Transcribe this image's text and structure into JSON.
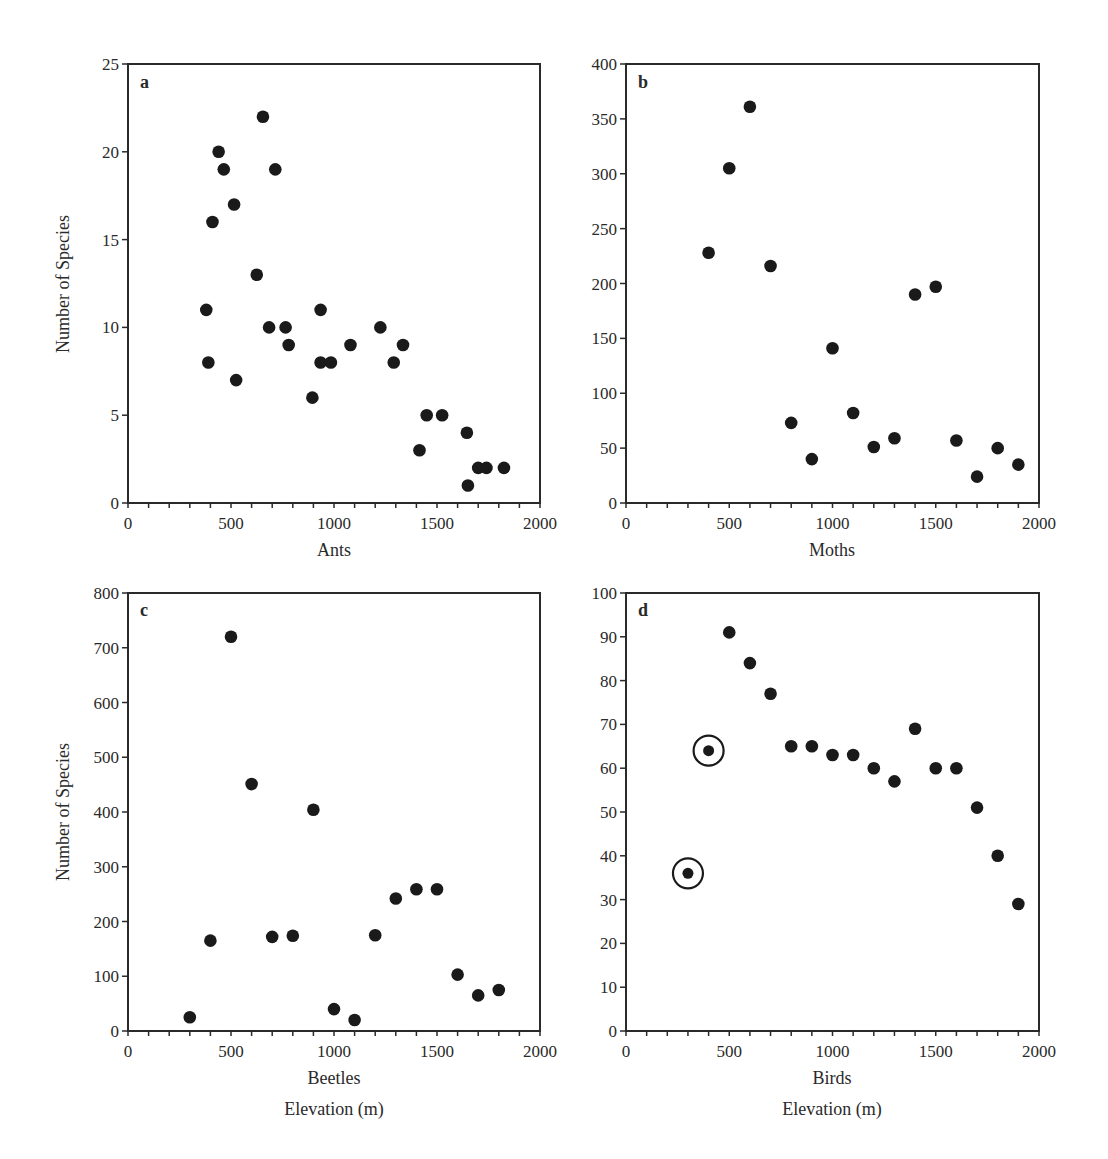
{
  "figure": {
    "xlabel_common": "Elevation (m)",
    "ylabel_common": "Number of Species"
  },
  "chart_data": [
    {
      "type": "scatter",
      "panel": "a",
      "title": "",
      "xlabel": "Ants",
      "ylabel": "Number of Species",
      "xlim": [
        0,
        2000
      ],
      "ylim": [
        0,
        25
      ],
      "xticks": [
        0,
        500,
        1000,
        1500,
        2000
      ],
      "yticks": [
        0,
        5,
        10,
        15,
        20,
        25
      ],
      "grid": false,
      "points": [
        {
          "x": 380,
          "y": 11
        },
        {
          "x": 390,
          "y": 8
        },
        {
          "x": 410,
          "y": 16
        },
        {
          "x": 440,
          "y": 20
        },
        {
          "x": 465,
          "y": 19
        },
        {
          "x": 515,
          "y": 17
        },
        {
          "x": 525,
          "y": 7
        },
        {
          "x": 625,
          "y": 13
        },
        {
          "x": 655,
          "y": 22
        },
        {
          "x": 685,
          "y": 10
        },
        {
          "x": 715,
          "y": 19
        },
        {
          "x": 765,
          "y": 10
        },
        {
          "x": 780,
          "y": 9
        },
        {
          "x": 895,
          "y": 6
        },
        {
          "x": 935,
          "y": 11
        },
        {
          "x": 935,
          "y": 8
        },
        {
          "x": 985,
          "y": 8
        },
        {
          "x": 1080,
          "y": 9
        },
        {
          "x": 1225,
          "y": 10
        },
        {
          "x": 1290,
          "y": 8
        },
        {
          "x": 1335,
          "y": 9
        },
        {
          "x": 1415,
          "y": 3
        },
        {
          "x": 1450,
          "y": 5
        },
        {
          "x": 1525,
          "y": 5
        },
        {
          "x": 1645,
          "y": 4
        },
        {
          "x": 1650,
          "y": 1
        },
        {
          "x": 1700,
          "y": 2
        },
        {
          "x": 1740,
          "y": 2
        },
        {
          "x": 1825,
          "y": 2
        }
      ]
    },
    {
      "type": "scatter",
      "panel": "b",
      "title": "",
      "xlabel": "Moths",
      "ylabel": "",
      "xlim": [
        0,
        2000
      ],
      "ylim": [
        0,
        400
      ],
      "xticks": [
        0,
        500,
        1000,
        1500,
        2000
      ],
      "yticks": [
        0,
        50,
        100,
        150,
        200,
        250,
        300,
        350,
        400
      ],
      "grid": false,
      "points": [
        {
          "x": 400,
          "y": 228
        },
        {
          "x": 500,
          "y": 305
        },
        {
          "x": 600,
          "y": 361
        },
        {
          "x": 700,
          "y": 216
        },
        {
          "x": 800,
          "y": 73
        },
        {
          "x": 900,
          "y": 40
        },
        {
          "x": 1000,
          "y": 141
        },
        {
          "x": 1100,
          "y": 82
        },
        {
          "x": 1200,
          "y": 51
        },
        {
          "x": 1300,
          "y": 59
        },
        {
          "x": 1400,
          "y": 190
        },
        {
          "x": 1500,
          "y": 197
        },
        {
          "x": 1600,
          "y": 57
        },
        {
          "x": 1700,
          "y": 24
        },
        {
          "x": 1800,
          "y": 50
        },
        {
          "x": 1900,
          "y": 35
        }
      ]
    },
    {
      "type": "scatter",
      "panel": "c",
      "title": "",
      "xlabel": "Beetles",
      "ylabel": "Number of Species",
      "xlim": [
        0,
        2000
      ],
      "ylim": [
        0,
        800
      ],
      "xticks": [
        0,
        500,
        1000,
        1500,
        2000
      ],
      "yticks": [
        0,
        100,
        200,
        300,
        400,
        500,
        600,
        700,
        800
      ],
      "grid": false,
      "points": [
        {
          "x": 300,
          "y": 25
        },
        {
          "x": 400,
          "y": 165
        },
        {
          "x": 500,
          "y": 720
        },
        {
          "x": 600,
          "y": 451
        },
        {
          "x": 700,
          "y": 172
        },
        {
          "x": 800,
          "y": 174
        },
        {
          "x": 900,
          "y": 404
        },
        {
          "x": 1000,
          "y": 40
        },
        {
          "x": 1100,
          "y": 20
        },
        {
          "x": 1200,
          "y": 175
        },
        {
          "x": 1300,
          "y": 242
        },
        {
          "x": 1400,
          "y": 259
        },
        {
          "x": 1500,
          "y": 259
        },
        {
          "x": 1600,
          "y": 103
        },
        {
          "x": 1700,
          "y": 65
        },
        {
          "x": 1800,
          "y": 75
        }
      ]
    },
    {
      "type": "scatter",
      "panel": "d",
      "title": "",
      "xlabel": "Birds",
      "ylabel": "",
      "xlim": [
        0,
        2000
      ],
      "ylim": [
        0,
        100
      ],
      "xticks": [
        0,
        500,
        1000,
        1500,
        2000
      ],
      "yticks": [
        0,
        10,
        20,
        30,
        40,
        50,
        60,
        70,
        80,
        90,
        100
      ],
      "grid": false,
      "annotations": "Points at 300 m and 400 m are circled",
      "points": [
        {
          "x": 300,
          "y": 36,
          "circled": true
        },
        {
          "x": 400,
          "y": 64,
          "circled": true
        },
        {
          "x": 500,
          "y": 91
        },
        {
          "x": 600,
          "y": 84
        },
        {
          "x": 700,
          "y": 77
        },
        {
          "x": 800,
          "y": 65
        },
        {
          "x": 900,
          "y": 65
        },
        {
          "x": 1000,
          "y": 63
        },
        {
          "x": 1100,
          "y": 63
        },
        {
          "x": 1200,
          "y": 60
        },
        {
          "x": 1300,
          "y": 57
        },
        {
          "x": 1400,
          "y": 69
        },
        {
          "x": 1500,
          "y": 60
        },
        {
          "x": 1600,
          "y": 60
        },
        {
          "x": 1700,
          "y": 51
        },
        {
          "x": 1800,
          "y": 40
        },
        {
          "x": 1900,
          "y": 29
        }
      ]
    }
  ],
  "style": {
    "marker_color": "#1a1a1a",
    "axis_color": "#2a2a2a",
    "background": "#ffffff"
  }
}
